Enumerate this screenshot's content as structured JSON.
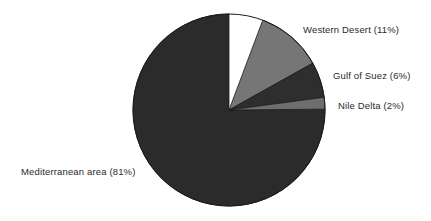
{
  "chart_data": {
    "type": "pie",
    "title": "",
    "categories": [
      "Mediterranean area",
      "Western Desert",
      "Gulf of Suez",
      "Nile Delta"
    ],
    "values": [
      81,
      11,
      6,
      2
    ],
    "value_unit": "%",
    "labels": [
      "Mediterranean area (81%)",
      "Western Desert (11%)",
      "Gulf of Suez (6%)",
      "Nile Delta (2%)"
    ],
    "slices": [
      {
        "name": "Mediterranean area",
        "percent": 81,
        "label": "Mediterranean area (81%)",
        "color": "#2b2b2b",
        "start_angle_deg": 89.5,
        "end_angle_deg": 360
      },
      {
        "name": "Western Desert",
        "percent": 11,
        "label": "Western Desert (11%)",
        "color": "#767676",
        "start_angle_deg": 20.6,
        "end_angle_deg": 60.8
      },
      {
        "name": "Gulf of Suez",
        "percent": 6,
        "label": "Gulf of Suez (6%)",
        "color": "#2e2e2e",
        "start_angle_deg": 60.8,
        "end_angle_deg": 82.4
      },
      {
        "name": "Nile Delta",
        "percent": 2,
        "label": "Nile Delta (2%)",
        "color": "#6e6e6e",
        "start_angle_deg": 82.4,
        "end_angle_deg": 89.5
      }
    ],
    "legend": "none",
    "grid": false,
    "xlabel": "",
    "ylabel": "",
    "background_color": "#ffffff",
    "outline_color": "#1a1a1a",
    "geometry": {
      "center_x": 229,
      "center_y": 110,
      "radius": 96
    }
  }
}
